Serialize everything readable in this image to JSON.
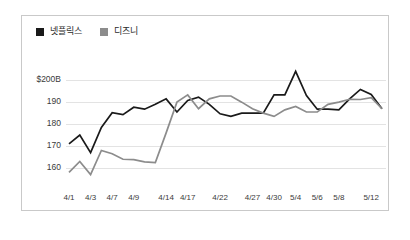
{
  "chart_data": {
    "type": "line",
    "title": "",
    "xlabel": "",
    "ylabel": "",
    "ylim": [
      155,
      206
    ],
    "grid": true,
    "legend_position": "top-left",
    "y_ticks": [
      {
        "value": 200,
        "label": "$200B"
      },
      {
        "value": 190,
        "label": "190"
      },
      {
        "value": 180,
        "label": "180"
      },
      {
        "value": 170,
        "label": "170"
      },
      {
        "value": 160,
        "label": "160"
      }
    ],
    "x_tick_labels": [
      "4/1",
      "4/3",
      "4/7",
      "4/9",
      "4/14",
      "4/17",
      "4/22",
      "4/27",
      "4/30",
      "5/4",
      "5/6",
      "5/8",
      "5/12"
    ],
    "x_tick_indices": [
      0,
      2,
      4,
      6,
      9,
      11,
      14,
      17,
      19,
      21,
      23,
      25,
      28
    ],
    "x": [
      "4/1",
      "4/2",
      "4/3",
      "4/6",
      "4/7",
      "4/8",
      "4/9",
      "4/10",
      "4/13",
      "4/14",
      "4/15",
      "4/16",
      "4/17",
      "4/20",
      "4/21",
      "4/22",
      "4/23",
      "4/24",
      "4/27",
      "4/28",
      "4/29",
      "4/30",
      "5/1",
      "5/4",
      "5/5",
      "5/6",
      "5/7",
      "5/8",
      "5/11",
      "5/12"
    ],
    "series": [
      {
        "name": "넷플릭스",
        "color": "#1a1a1a",
        "stroke_width": 1.7,
        "values": [
          171.0,
          175.0,
          167.0,
          178.5,
          185.2,
          184.3,
          187.7,
          186.8,
          189.0,
          191.5,
          185.5,
          190.8,
          192.3,
          189.0,
          184.7,
          183.5,
          185.0,
          185.0,
          185.0,
          193.3,
          193.3,
          204.0,
          193.0,
          186.8,
          186.8,
          186.5,
          191.5,
          195.8,
          193.5,
          187.0
        ]
      },
      {
        "name": "디즈니",
        "color": "#8c8c8c",
        "stroke_width": 1.7,
        "values": [
          158.0,
          163.0,
          157.0,
          168.0,
          166.5,
          164.0,
          163.8,
          162.8,
          162.5,
          176.0,
          190.0,
          193.3,
          187.0,
          191.5,
          192.8,
          192.8,
          190.0,
          187.0,
          185.0,
          183.5,
          186.5,
          188.0,
          185.5,
          185.5,
          189.0,
          190.0,
          191.3,
          191.2,
          192.0,
          187.0
        ]
      }
    ]
  },
  "legend": {
    "entries": [
      {
        "label": "넷플릭스",
        "color": "#1a1a1a"
      },
      {
        "label": "디즈니",
        "color": "#8c8c8c"
      }
    ]
  }
}
